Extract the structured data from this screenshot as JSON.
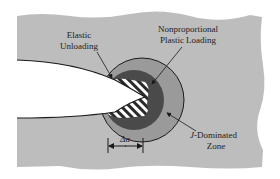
{
  "diagram": {
    "labels": {
      "elastic_unloading": [
        "Elastic",
        "Unloading"
      ],
      "nonproportional": [
        "Nonproportional",
        "Plastic Loading"
      ],
      "j_dominated": {
        "italic": "J",
        "rest": "-Dominated",
        "line2": "Zone"
      },
      "delta_a": "Δa"
    },
    "colors": {
      "background_material": "#bdbdbd",
      "j_zone": "#9a9a9a",
      "plastic_zone": "#4a4a4a",
      "hatch_stripe": "#ffffff",
      "hatch_dark": "#2a2a2a",
      "crack": "#ffffff",
      "outline": "#1a1a1a"
    }
  }
}
